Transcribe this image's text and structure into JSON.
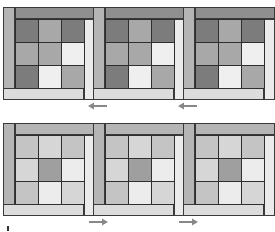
{
  "colors": {
    "dark": "#7c7c7c",
    "mid": "#a8a8a8",
    "light": "#efefef",
    "bar_dark": "#8f8f8f",
    "bar_mid": "#b5b5b5",
    "bar_light": "#dcdcdc",
    "strip_light": "#ebebeb",
    "row2_a": "#c4c4c4",
    "row2_b": "#d6d6d6",
    "row2_dark": "#9f9f9f",
    "row2_light": "#ececec",
    "arrow": "#888888",
    "line": "#2e2e2e"
  },
  "rows": [
    {
      "name": "top-row",
      "arrow_direction": "left",
      "panels": [
        {
          "grid": [
            [
              "dark",
              "mid",
              "dark"
            ],
            [
              "mid",
              "mid",
              "light"
            ],
            [
              "dark",
              "light",
              "mid"
            ]
          ]
        },
        {
          "grid": [
            [
              "dark",
              "mid",
              "dark"
            ],
            [
              "mid",
              "mid",
              "light"
            ],
            [
              "dark",
              "light",
              "mid"
            ]
          ]
        },
        {
          "grid": [
            [
              "dark",
              "mid",
              "dark"
            ],
            [
              "mid",
              "mid",
              "light"
            ],
            [
              "dark",
              "light",
              "mid"
            ]
          ]
        }
      ]
    },
    {
      "name": "bottom-row",
      "arrow_direction": "right",
      "panels": [
        {
          "grid": [
            [
              "row2_a",
              "row2_b",
              "row2_a"
            ],
            [
              "row2_b",
              "row2_dark",
              "row2_light"
            ],
            [
              "row2_a",
              "row2_light",
              "row2_b"
            ]
          ]
        },
        {
          "grid": [
            [
              "row2_a",
              "row2_b",
              "row2_a"
            ],
            [
              "row2_b",
              "row2_dark",
              "row2_light"
            ],
            [
              "row2_a",
              "row2_light",
              "row2_b"
            ]
          ]
        },
        {
          "grid": [
            [
              "row2_a",
              "row2_b",
              "row2_a"
            ],
            [
              "row2_b",
              "row2_dark",
              "row2_light"
            ],
            [
              "row2_a",
              "row2_light",
              "row2_b"
            ]
          ]
        }
      ]
    }
  ],
  "icons": {
    "arrow_left": "arrow-left-icon",
    "arrow_right": "arrow-right-icon"
  }
}
